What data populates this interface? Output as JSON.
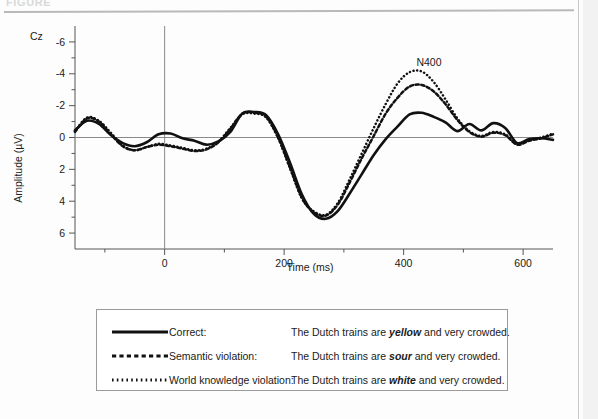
{
  "figure": {
    "caption_partial": "FIGURE",
    "channel_label": "Cz",
    "peak_annotation": "N400"
  },
  "chart_data": {
    "type": "line",
    "title": "",
    "subtitle": "",
    "xlabel": "Time (ms)",
    "ylabel": "Amplitude (µV)",
    "channel": "Cz",
    "xlim": [
      -150,
      650
    ],
    "ylim": [
      7,
      -7
    ],
    "y_inverted": true,
    "grid": false,
    "legend_position": "below-plot",
    "xticks_major": [
      0,
      200,
      400,
      600
    ],
    "xtick_labels": [
      "0",
      "200",
      "400",
      "600"
    ],
    "xticks_minor": [
      -100,
      100,
      300,
      500
    ],
    "yticks_major": [
      -6,
      -4,
      -2,
      0,
      2,
      4,
      6
    ],
    "ytick_labels": [
      "-6",
      "-4",
      "-2",
      "0",
      "2",
      "4",
      "6"
    ],
    "yticks_minor": [
      -5,
      -3,
      -1,
      1,
      3,
      5
    ],
    "annotations": [
      {
        "text": "N400",
        "x": 400,
        "y": -5.0
      }
    ],
    "stimulus_onset_ms": 0,
    "x": [
      -150,
      -130,
      -110,
      -90,
      -70,
      -50,
      -30,
      -10,
      10,
      30,
      50,
      70,
      90,
      110,
      130,
      150,
      170,
      190,
      210,
      230,
      250,
      270,
      290,
      310,
      330,
      350,
      370,
      390,
      410,
      430,
      450,
      470,
      490,
      510,
      530,
      550,
      570,
      590,
      610,
      630,
      650
    ],
    "series": [
      {
        "name": "Correct",
        "style": "solid",
        "color": "#111111",
        "sentence": "The Dutch trains are yellow and very crowded.",
        "critical_word": "yellow",
        "values": [
          -0.45,
          -1.05,
          -0.85,
          -0.15,
          0.35,
          0.55,
          0.3,
          -0.2,
          -0.25,
          0.05,
          0.2,
          0.45,
          0.25,
          -0.35,
          -1.5,
          -1.6,
          -1.4,
          -0.2,
          1.6,
          3.6,
          4.8,
          5.1,
          4.6,
          3.5,
          2.3,
          1.1,
          0.1,
          -0.7,
          -1.45,
          -1.55,
          -1.3,
          -0.95,
          -0.4,
          -0.85,
          -0.45,
          -0.9,
          -0.6,
          0.35,
          0.1,
          0.05,
          0.15
        ]
      },
      {
        "name": "Semantic violation",
        "style": "dashed",
        "color": "#111111",
        "sentence": "The Dutch trains are sour and very crowded.",
        "critical_word": "sour",
        "values": [
          -0.35,
          -1.2,
          -1.0,
          -0.2,
          0.55,
          0.8,
          0.6,
          0.45,
          0.55,
          0.7,
          0.85,
          0.75,
          0.3,
          -0.55,
          -1.5,
          -1.55,
          -1.3,
          0.0,
          1.9,
          3.8,
          4.7,
          4.9,
          4.2,
          2.8,
          1.3,
          -0.1,
          -1.5,
          -2.5,
          -3.2,
          -3.3,
          -2.9,
          -2.1,
          -1.1,
          -0.35,
          -0.05,
          -0.3,
          -0.15,
          0.45,
          0.2,
          0.05,
          -0.2
        ]
      },
      {
        "name": "World knowledge violation",
        "style": "dotted",
        "color": "#111111",
        "sentence": "The Dutch trains are white and very crowded.",
        "critical_word": "white",
        "values": [
          -0.4,
          -1.25,
          -1.05,
          -0.3,
          0.5,
          0.8,
          0.6,
          0.4,
          0.5,
          0.65,
          0.8,
          0.7,
          0.25,
          -0.6,
          -1.45,
          -1.5,
          -1.25,
          0.05,
          1.95,
          3.85,
          4.65,
          4.85,
          4.1,
          2.6,
          1.0,
          -0.6,
          -2.1,
          -3.4,
          -4.1,
          -4.15,
          -3.5,
          -2.4,
          -1.2,
          -0.4,
          -0.1,
          -0.35,
          -0.2,
          0.4,
          0.15,
          0.0,
          -0.25
        ]
      }
    ]
  },
  "legend": {
    "rows": [
      {
        "swatch": "solid-line",
        "name": "Correct:",
        "sentence_pre": "The Dutch trains are ",
        "sentence_em": "yellow",
        "sentence_post": " and very crowded."
      },
      {
        "swatch": "dashed-line",
        "name": "Semantic violation:",
        "sentence_pre": "The Dutch trains are ",
        "sentence_em": "sour",
        "sentence_post": " and very crowded."
      },
      {
        "swatch": "dotted-line",
        "name": "World knowledge violation:",
        "sentence_pre": "The Dutch trains are ",
        "sentence_em": "white",
        "sentence_post": " and very crowded."
      }
    ]
  }
}
